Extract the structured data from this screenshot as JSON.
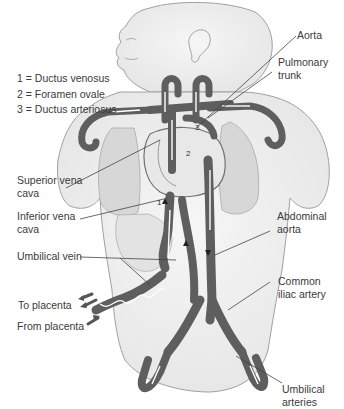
{
  "diagram": {
    "legend": [
      {
        "number": "1",
        "label": "1 = Ductus venosus"
      },
      {
        "number": "2",
        "label": "2 = Foramen ovale"
      },
      {
        "number": "3",
        "label": "3 = Ductus arteriosus"
      }
    ],
    "labels": {
      "aorta": "Aorta",
      "pulmonary_trunk": "Pulmonary\ntrunk",
      "superior_vena_cava": "Superior vena\ncava",
      "inferior_vena_cava": "Inferior vena\ncava",
      "umbilical_vein": "Umbilical vein",
      "abdominal_aorta": "Abdominal\naorta",
      "common_iliac_artery": "Common\niliac artery",
      "to_placenta": "To placenta",
      "from_placenta": "From placenta",
      "umbilical_arteries": "Umbilical\narteries"
    },
    "markers": {
      "m1": "1",
      "m2": "2",
      "m3": "3"
    },
    "colors": {
      "vessel": "#5e5e5e",
      "vessel_dark": "#3d3d3d",
      "body_fill": "#f2f2f2",
      "body_outline": "#9a9a9a",
      "lung_fill": "#d9d9d9",
      "leader_line": "#444444",
      "text": "#3a3a3a"
    }
  }
}
